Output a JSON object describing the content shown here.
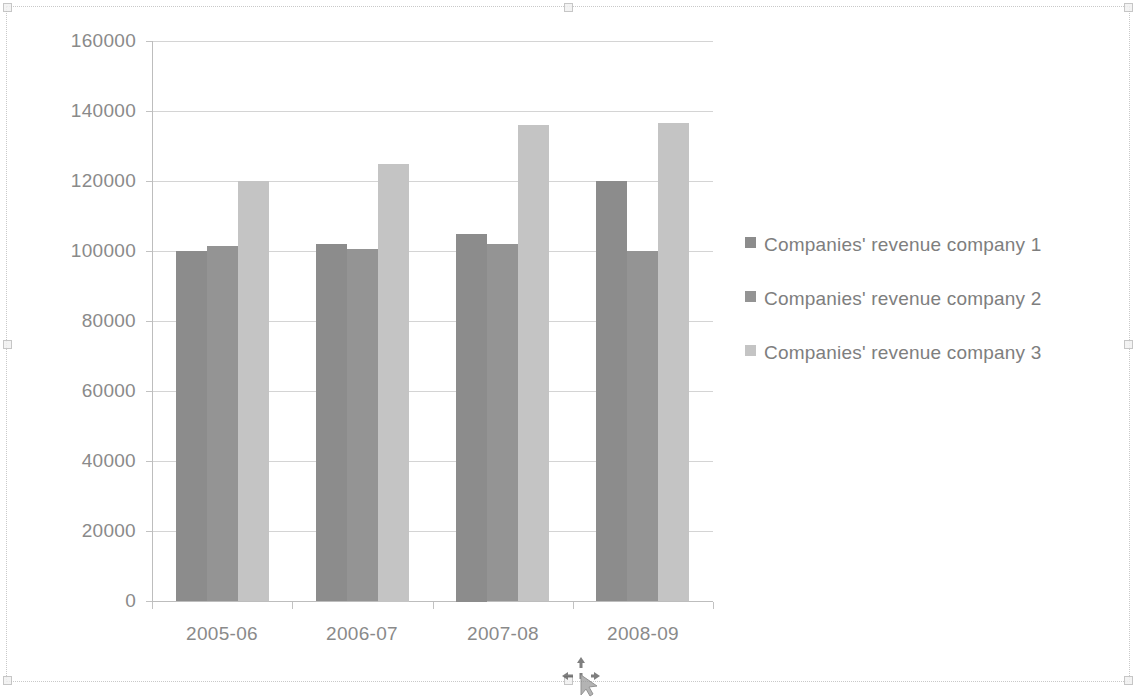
{
  "object": {
    "name": "Embedded chart object",
    "selected": true,
    "cursor": "move-cursor"
  },
  "chart_data": {
    "type": "bar",
    "title": "",
    "subtitle": "",
    "xlabel": "",
    "ylabel": "",
    "categories": [
      "2005-06",
      "2006-07",
      "2007-08",
      "2008-09"
    ],
    "series": [
      {
        "name": "Companies' revenue company 1",
        "color": "#8c8c8c",
        "values": [
          100000,
          102000,
          105000,
          120000
        ]
      },
      {
        "name": "Companies' revenue company 2",
        "color": "#949494",
        "values": [
          101500,
          100500,
          102000,
          100000
        ]
      },
      {
        "name": "Companies' revenue company 3",
        "color": "#c4c4c4",
        "values": [
          120000,
          125000,
          136000,
          136500
        ]
      }
    ],
    "ylim": [
      0,
      160000
    ],
    "ytick_labels": [
      "0",
      "20000",
      "40000",
      "60000",
      "80000",
      "100000",
      "120000",
      "140000",
      "160000"
    ],
    "ytick_values": [
      0,
      20000,
      40000,
      60000,
      80000,
      100000,
      120000,
      140000,
      160000
    ],
    "grid": true,
    "grid_axis": "y",
    "legend_position": "right",
    "legend_entries": [
      "Companies' revenue company 1",
      "Companies' revenue company 2",
      "Companies' revenue company 3"
    ]
  },
  "colors": {
    "gridline": "#d4d4d4",
    "axis": "#bdbdbd",
    "tick_text": "#8a8a8a",
    "legend_text": "#7e7e7e",
    "series_1": "#8c8c8c",
    "series_2": "#949494",
    "series_3": "#c4c4c4",
    "background": "#ffffff"
  }
}
